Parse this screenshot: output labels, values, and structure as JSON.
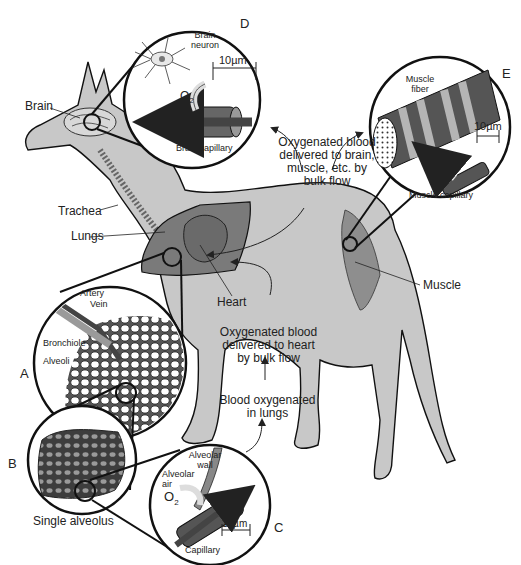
{
  "figure": {
    "colors": {
      "body_fill": "#c8c8c8",
      "organ_fill": "#7a7a7a",
      "muscle_fill": "#8e8e8e",
      "outline": "#111111",
      "background": "#ffffff"
    },
    "organ_labels": {
      "brain": "Brain",
      "trachea": "Trachea",
      "lungs": "Lungs",
      "heart": "Heart",
      "muscle": "Muscle"
    },
    "flow_labels": {
      "to_tissues": [
        "Oxygenated blood",
        "delivered to brain,",
        "muscle, etc. by",
        "bulk flow"
      ],
      "to_heart": [
        "Oxygenated blood",
        "delivered to heart",
        "by bulk flow"
      ],
      "in_lungs": [
        "Blood oxygenated",
        "in lungs"
      ]
    },
    "panels": {
      "A": {
        "letter": "A",
        "labels": {
          "artery": "Artery",
          "vein": "Vein",
          "bronchiole": "Bronchiole",
          "alveoli": "Alveoli"
        }
      },
      "B": {
        "letter": "B",
        "caption": "Single alveolus"
      },
      "C": {
        "letter": "C",
        "labels": {
          "alveolar_wall": [
            "Alveolar",
            "wall"
          ],
          "alveolar_air": [
            "Alveolar",
            "air"
          ],
          "o2": "O",
          "o2_sub": "2",
          "capillary": "Capillary",
          "scale": "10µm"
        }
      },
      "D": {
        "letter": "D",
        "labels": {
          "neuron": [
            "Brain",
            "neuron"
          ],
          "o2": "O",
          "o2_sub": "2",
          "capillary": "Brain capillary",
          "scale": "10µm"
        }
      },
      "E": {
        "letter": "E",
        "labels": {
          "fiber": [
            "Muscle",
            "fiber"
          ],
          "o2": "O",
          "o2_sub": "2",
          "capillary": "Muscle capillary",
          "scale": "10µm"
        }
      }
    }
  }
}
